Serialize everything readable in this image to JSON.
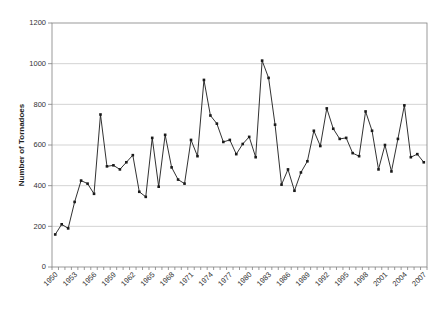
{
  "chart_data": {
    "type": "line",
    "title": "",
    "xlabel": "",
    "ylabel": "Number of Tornadoes",
    "ylim": [
      0,
      1200
    ],
    "yticks": [
      0,
      200,
      400,
      600,
      800,
      1000,
      1200
    ],
    "grid": "horizontal-gridlines",
    "legend": "none",
    "x_tick_labels": [
      "1950",
      "1953",
      "1956",
      "1959",
      "1962",
      "1965",
      "1968",
      "1971",
      "1974",
      "1977",
      "1980",
      "1983",
      "1986",
      "1989",
      "1992",
      "1995",
      "1998",
      "2001",
      "2004",
      "2007"
    ],
    "x": [
      1950,
      1951,
      1952,
      1953,
      1954,
      1955,
      1956,
      1957,
      1958,
      1959,
      1960,
      1961,
      1962,
      1963,
      1964,
      1965,
      1966,
      1967,
      1968,
      1969,
      1970,
      1971,
      1972,
      1973,
      1974,
      1975,
      1976,
      1977,
      1978,
      1979,
      1980,
      1981,
      1982,
      1983,
      1984,
      1985,
      1986,
      1987,
      1988,
      1989,
      1990,
      1991,
      1992,
      1993,
      1994,
      1995,
      1996,
      1997,
      1998,
      1999,
      2000,
      2001,
      2002,
      2003,
      2004,
      2005,
      2006,
      2007
    ],
    "values": [
      160,
      210,
      190,
      320,
      425,
      410,
      360,
      750,
      495,
      500,
      480,
      515,
      550,
      370,
      345,
      635,
      395,
      650,
      490,
      430,
      410,
      625,
      545,
      920,
      745,
      705,
      615,
      625,
      555,
      605,
      640,
      540,
      1015,
      930,
      700,
      405,
      480,
      375,
      465,
      520,
      670,
      595,
      780,
      680,
      630,
      635,
      560,
      545,
      765,
      670,
      480,
      600,
      470,
      630,
      795,
      540,
      555,
      515
    ],
    "series_name": "Number of Tornadoes",
    "marker": "square",
    "colors": {
      "line": "#1a1a1a",
      "marker": "#1a1a1a",
      "gridline": "#c0c0c0",
      "axis": "#808080",
      "text": "#333333",
      "background": "#ffffff"
    }
  }
}
